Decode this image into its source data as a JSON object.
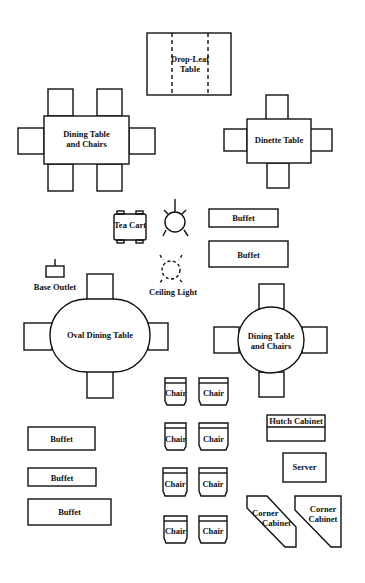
{
  "diagram": {
    "stroke_color": "#111111",
    "background": "#ffffff",
    "pieces": {
      "drop_leaf": {
        "label_1": "Drop-Leaf",
        "label_2": "Table"
      },
      "dining_rect": {
        "label_1": "Dining Table",
        "label_2": "and Chairs"
      },
      "dinette": {
        "label": "Dinette Table"
      },
      "tea_cart": {
        "label": "Tea Cart"
      },
      "ceiling_light": {
        "label": "Ceiling Light"
      },
      "buffet_small_top": {
        "label": "Buffet"
      },
      "buffet_large_top": {
        "label": "Buffet"
      },
      "base_outlet": {
        "label": "Base Outlet"
      },
      "oval_table": {
        "label": "Oval Dining Table"
      },
      "round_table": {
        "label_1": "Dining Table",
        "label_2": "and Chairs"
      },
      "chairs": [
        "Chair",
        "Chair",
        "Chair",
        "Chair",
        "Chair",
        "Chair",
        "Chair",
        "Chair"
      ],
      "buffet_left_1": {
        "label": "Buffet"
      },
      "buffet_left_2": {
        "label": "Buffet"
      },
      "buffet_left_3": {
        "label": "Buffet"
      },
      "hutch": {
        "label": "Hutch Cabinet"
      },
      "server": {
        "label": "Server"
      },
      "corner_cabinet_1": {
        "label_1": "Corner",
        "label_2": "Cabinet"
      },
      "corner_cabinet_2": {
        "label_1": "Corner",
        "label_2": "Cabinet"
      }
    }
  }
}
